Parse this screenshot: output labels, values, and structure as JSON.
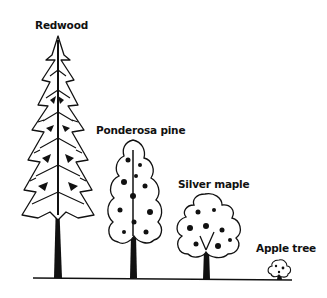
{
  "figure": {
    "labels": {
      "redwood": "Redwood",
      "ponderosa": "Ponderosa pine",
      "maple": "Silver maple",
      "apple": "Apple tree"
    },
    "colors": {
      "ink": "#111111",
      "background": "#ffffff"
    }
  }
}
